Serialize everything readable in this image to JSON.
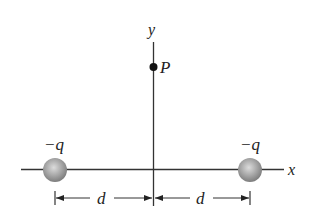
{
  "diagram": {
    "type": "physics-charge-configuration",
    "axes": {
      "x_label": "x",
      "y_label": "y"
    },
    "point": {
      "label": "P"
    },
    "charges": [
      {
        "label": "−q",
        "position": "left"
      },
      {
        "label": "−q",
        "position": "right"
      }
    ],
    "dimensions": [
      {
        "label": "d",
        "span": "left-charge-to-origin"
      },
      {
        "label": "d",
        "span": "origin-to-right-charge"
      }
    ],
    "colors": {
      "line": "#333333",
      "charge_fill": "#9a9a9a",
      "charge_highlight": "#d8d8d8",
      "point": "#111111",
      "text": "#222222"
    }
  }
}
